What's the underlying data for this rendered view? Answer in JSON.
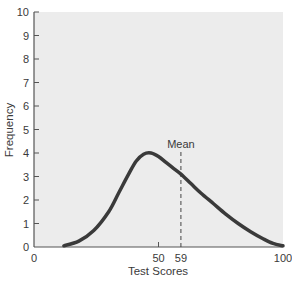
{
  "chart_data": {
    "type": "line",
    "title": "",
    "xlabel": "Test Scores",
    "ylabel": "Frequency",
    "xlim": [
      0,
      100
    ],
    "ylim": [
      0,
      10
    ],
    "x_ticks": [
      0,
      50,
      59,
      100
    ],
    "y_ticks": [
      0,
      1,
      2,
      3,
      4,
      5,
      6,
      7,
      8,
      9,
      10
    ],
    "grid": false,
    "legend": null,
    "series": [
      {
        "name": "Distribution of test scores (positively skewed)",
        "x": [
          12,
          18,
          24,
          30,
          34,
          38,
          41,
          44,
          47,
          50,
          53,
          56,
          59,
          63,
          67,
          72,
          77,
          82,
          87,
          92,
          96,
          100
        ],
        "y": [
          0.05,
          0.25,
          0.7,
          1.5,
          2.3,
          3.1,
          3.65,
          3.95,
          4.0,
          3.85,
          3.6,
          3.35,
          3.1,
          2.7,
          2.3,
          1.85,
          1.4,
          1.0,
          0.65,
          0.35,
          0.15,
          0.05
        ]
      }
    ],
    "annotations": [
      {
        "type": "vertical-dashed-line",
        "x": 59,
        "label": "Mean"
      }
    ],
    "background_color": "#ececec",
    "line_color": "#3a3a3a"
  },
  "labels": {
    "xlabel": "Test Scores",
    "ylabel": "Frequency",
    "mean": "Mean"
  }
}
